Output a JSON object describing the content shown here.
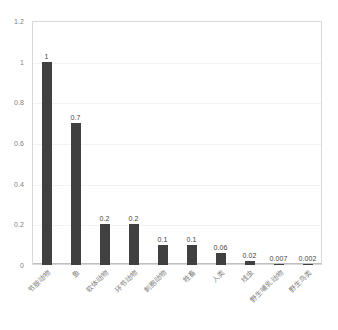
{
  "chart_data": {
    "type": "bar",
    "title": "",
    "subtitle": "",
    "xlabel": "",
    "ylabel": "",
    "ylim": [
      0,
      1.2
    ],
    "ytick_values": [
      0,
      0.2,
      0.4,
      0.6,
      0.8,
      1,
      1.2
    ],
    "ytick_labels": [
      "0",
      "0.2",
      "0.4",
      "0.6",
      "0.8",
      "1",
      "1.2"
    ],
    "grid": true,
    "legend": false,
    "legend_position": "none",
    "categories": [
      "节肢动物",
      "鱼",
      "软体动物",
      "环节动物",
      "刺胞动物",
      "牲畜",
      "人类",
      "线虫",
      "野生哺乳动物",
      "野生鸟类"
    ],
    "values": [
      1,
      0.7,
      0.2,
      0.2,
      0.1,
      0.1,
      0.06,
      0.02,
      0.007,
      0.002
    ],
    "data_labels": [
      "1",
      "0.7",
      "0.2",
      "0.2",
      "0.1",
      "0.1",
      "0.06",
      "0.02",
      "0.007",
      "0.002"
    ],
    "bar_color": "#404040",
    "plot_border_color": "#d9d9d9",
    "gridline_color": "#f2f2f2",
    "axis_label_color": "#808080",
    "background_color": "#ffffff"
  }
}
